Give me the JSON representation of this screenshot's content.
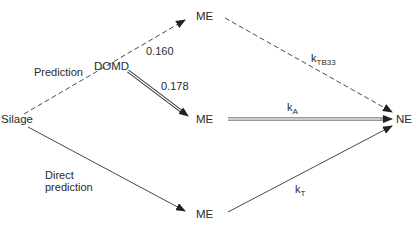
{
  "nodes": {
    "silage": "Silage",
    "domd": "DOMD",
    "me_top": "ME",
    "me_mid": "ME",
    "me_bottom": "ME",
    "ne": "NE"
  },
  "edge_labels": {
    "prediction": "Prediction",
    "direct_line1": "Direct",
    "direct_line2": "prediction",
    "domd_to_me_top": "0.160",
    "domd_to_me_mid": "0.178",
    "k_tb33_base": "k",
    "k_tb33_sub": "TB33",
    "k_a_base": "k",
    "k_a_sub": "A",
    "k_t_base": "k",
    "k_t_sub": "T"
  },
  "colors": {
    "line": "#333333",
    "text": "#2a2a2a"
  }
}
